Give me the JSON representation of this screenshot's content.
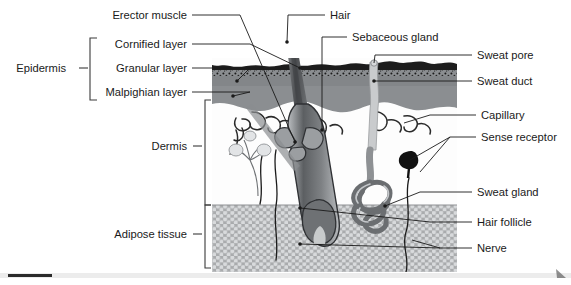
{
  "figure": {
    "illustration": {
      "left": 212,
      "top": 58,
      "right": 457,
      "bottom": 272
    },
    "colors": {
      "cornified": "#1c1c1c",
      "granular": "#6f7174",
      "malpighian": "#8b8e91",
      "dermis": "#fdfdfd",
      "adipose_fill": "#a9abad",
      "adipose_cell": "#d6d8da",
      "hair": "#57595c",
      "hair_dark": "#3a3c3f",
      "gland": "#a0a3a6",
      "duct": "#c9cbcd",
      "receptor": "#111111",
      "leader": "#1a1a1a",
      "bracket": "#3a3a3a",
      "scrollbar_thumb": "#2b2b2b",
      "scrollbar_track": "#e8e8e8"
    }
  },
  "labels": {
    "left": [
      {
        "id": "erector-muscle",
        "text": "Erector muscle",
        "x": 187,
        "y": 19
      },
      {
        "id": "cornified-layer",
        "text": "Cornified layer",
        "x": 187,
        "y": 48
      },
      {
        "id": "granular-layer",
        "text": "Granular layer",
        "x": 187,
        "y": 72
      },
      {
        "id": "malpighian-layer",
        "text": "Malpighian layer",
        "x": 187,
        "y": 96
      },
      {
        "id": "dermis",
        "text": "Dermis",
        "x": 187,
        "y": 150
      },
      {
        "id": "adipose-tissue",
        "text": "Adipose tissue",
        "x": 187,
        "y": 238
      }
    ],
    "group": {
      "id": "epidermis",
      "text": "Epidermis",
      "x": 66,
      "y": 72
    },
    "right": [
      {
        "id": "hair",
        "text": "Hair",
        "x": 330,
        "y": 19
      },
      {
        "id": "sebaceous-gland",
        "text": "Sebaceous gland",
        "x": 352,
        "y": 41
      },
      {
        "id": "sweat-pore",
        "text": "Sweat pore",
        "x": 477,
        "y": 59
      },
      {
        "id": "sweat-duct",
        "text": "Sweat duct",
        "x": 477,
        "y": 85
      },
      {
        "id": "capillary",
        "text": "Capillary",
        "x": 481,
        "y": 119
      },
      {
        "id": "sense-receptor",
        "text": "Sense receptor",
        "x": 481,
        "y": 141
      },
      {
        "id": "sweat-gland",
        "text": "Sweat gland",
        "x": 477,
        "y": 196
      },
      {
        "id": "hair-follicle",
        "text": "Hair follicle",
        "x": 477,
        "y": 226
      },
      {
        "id": "nerve",
        "text": "Nerve",
        "x": 477,
        "y": 252
      }
    ]
  },
  "scrollbar": {
    "value": 0,
    "thumb_width": 44
  }
}
